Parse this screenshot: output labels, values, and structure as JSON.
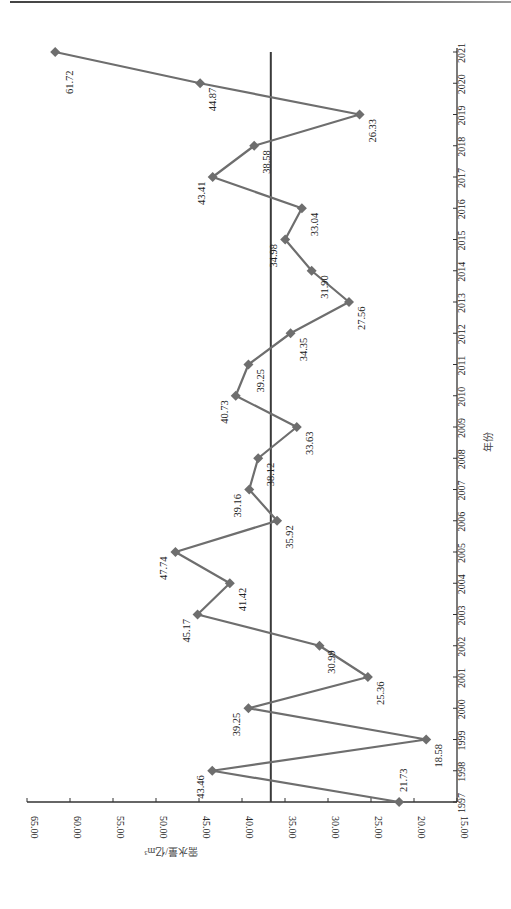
{
  "chart_data": {
    "type": "line",
    "orientation": "rotated-90-ccw",
    "title": "",
    "xlabel": "年份",
    "ylabel": "需水量/亿m³",
    "categories": [
      "1997",
      "1998",
      "1999",
      "2000",
      "2001",
      "2002",
      "2003",
      "2004",
      "2005",
      "2006",
      "2007",
      "2008",
      "2009",
      "2010",
      "2011",
      "2012",
      "2013",
      "2014",
      "2015",
      "2016",
      "2017",
      "2018",
      "2019",
      "2020",
      "2021"
    ],
    "series": [
      {
        "name": "需水量",
        "color": "#6e6e6e",
        "marker": "diamond",
        "values": [
          21.73,
          43.46,
          18.58,
          39.25,
          25.36,
          30.99,
          45.17,
          41.42,
          47.74,
          35.92,
          39.16,
          38.12,
          33.63,
          40.73,
          39.25,
          34.35,
          27.56,
          31.9,
          34.98,
          33.04,
          43.41,
          38.58,
          26.33,
          44.87,
          61.72
        ],
        "labels": [
          "21.73",
          "43.46",
          "18.58",
          "39.25",
          "25.36",
          "30.99",
          "45.17",
          "41.42",
          "47.74",
          "35.92",
          "39.16",
          "38.12",
          "33.63",
          "40.73",
          "39.25",
          "34.35",
          "27.56",
          "31.90",
          "34.98",
          "33.04",
          "43.41",
          "38.58",
          "26.33",
          "44.87",
          "61.72"
        ]
      }
    ],
    "reference_line": {
      "name": "平均值",
      "value": 36.65,
      "color": "#3a3a3a"
    },
    "yticks": [
      "15.00",
      "20.00",
      "25.00",
      "30.00",
      "35.00",
      "40.00",
      "45.00",
      "50.00",
      "55.00",
      "60.00",
      "65.00"
    ],
    "ylim": [
      15,
      65
    ],
    "grid": false,
    "legend": null
  }
}
